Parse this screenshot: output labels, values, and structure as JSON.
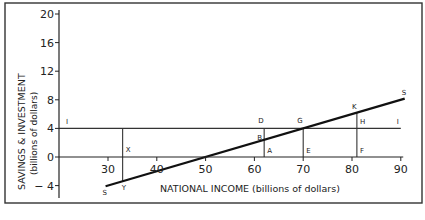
{
  "chart_data": {
    "type": "line",
    "title": "",
    "xlabel": "NATIONAL INCOME (billions of dollars)",
    "ylabel": "SAVINGS & INVESTMENT",
    "ylabel_sub": "(billions of dollars)",
    "xlim": [
      20,
      94
    ],
    "ylim": [
      -5.5,
      20.5
    ],
    "x_ticks": [
      30,
      40,
      50,
      60,
      70,
      80,
      90
    ],
    "y_ticks": [
      20,
      16,
      12,
      8,
      4,
      0,
      -4
    ],
    "y_tick_labels": [
      "20",
      "16",
      "12",
      "8",
      "4",
      "0",
      "− 4"
    ],
    "grid": false,
    "series": [
      {
        "name": "S (Savings)",
        "label_start": "S",
        "label_end": "S",
        "x": [
          29.5,
          90.8
        ],
        "y": [
          -4.1,
          8.16
        ]
      },
      {
        "name": "I (Investment)",
        "label_start": "I",
        "label_end": "I",
        "x": [
          20,
          90
        ],
        "y": [
          4,
          4
        ]
      }
    ],
    "guide_lines": [
      {
        "x": 33,
        "y_from": 4,
        "y_to": -3.4
      },
      {
        "x": 62,
        "y_from": 4,
        "y_to": 0
      },
      {
        "x": 70,
        "y_from": 4,
        "y_to": 0
      },
      {
        "x": 81,
        "y_from": 6.2,
        "y_to": 0
      }
    ],
    "point_labels": [
      {
        "text": "X",
        "x": 33,
        "y": 0,
        "dx": 3,
        "dy": -5
      },
      {
        "text": "Y",
        "x": 33,
        "y": -3.4,
        "dx": -1,
        "dy": 9
      },
      {
        "text": "D",
        "x": 62,
        "y": 4,
        "dx": -6,
        "dy": -5
      },
      {
        "text": "B",
        "x": 62,
        "y": 2.4,
        "dx": -7,
        "dy": 0
      },
      {
        "text": "A",
        "x": 62,
        "y": 0,
        "dx": 3,
        "dy": -4
      },
      {
        "text": "G",
        "x": 70,
        "y": 4,
        "dx": -6,
        "dy": -5
      },
      {
        "text": "E",
        "x": 70,
        "y": 0,
        "dx": 3,
        "dy": -4
      },
      {
        "text": "K",
        "x": 81,
        "y": 6.2,
        "dx": -5,
        "dy": -4
      },
      {
        "text": "H",
        "x": 81,
        "y": 4,
        "dx": 3,
        "dy": -4
      },
      {
        "text": "F",
        "x": 81,
        "y": 0,
        "dx": 3,
        "dy": -4
      }
    ],
    "annotations": [
      "Break-even at national income 50",
      "Equilibrium at G: income 70, S = I = 4"
    ]
  }
}
